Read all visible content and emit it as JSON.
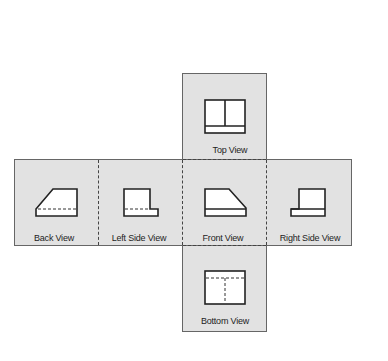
{
  "diagram": {
    "type": "orthographic-projection-unfolded-glass-box",
    "views": [
      {
        "id": "top",
        "label": "Top View"
      },
      {
        "id": "back",
        "label": "Back View"
      },
      {
        "id": "left",
        "label": "Left Side View"
      },
      {
        "id": "front",
        "label": "Front View"
      },
      {
        "id": "right",
        "label": "Right Side View"
      },
      {
        "id": "bottom",
        "label": "Bottom View"
      }
    ],
    "colors": {
      "panel": "#e2e2e2",
      "line": "#222222",
      "fold": "#444444"
    }
  }
}
